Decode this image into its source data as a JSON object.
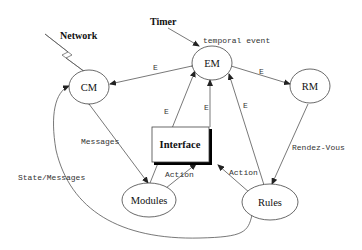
{
  "diagram": {
    "external": {
      "timer": "Timer",
      "network": "Network"
    },
    "nodes": {
      "cm": "CM",
      "em": "EM",
      "rm": "RM",
      "interface": "Interface",
      "modules": "Modules",
      "rules": "Rules"
    },
    "edges": {
      "timer_em": "temporal event",
      "em_cm": "E",
      "em_rm": "E",
      "modules_em": "E",
      "interface_em": "E",
      "rules_em": "E",
      "cm_modules": "Messages",
      "rm_rules": "Rendez-Vous",
      "modules_interface": "Action",
      "rules_interface": "Action",
      "rules_cm": "State/Messages"
    }
  }
}
